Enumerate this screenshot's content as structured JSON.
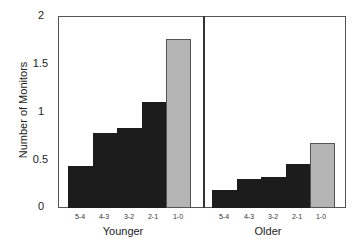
{
  "chart_data": {
    "type": "bar",
    "title": "",
    "ylabel": "Number of Monitors",
    "xlabel": "",
    "ylim": [
      0,
      2
    ],
    "yticks": [
      "0",
      "0.5",
      "1",
      "1.5",
      "2"
    ],
    "grid": false,
    "legend": null,
    "categories": [
      "5-4",
      "4-3",
      "3-2",
      "2-1",
      "1-0"
    ],
    "panels": [
      {
        "name": "Younger",
        "values": [
          0.44,
          0.78,
          0.83,
          1.1,
          1.76
        ],
        "colors": [
          "#1c1c1c",
          "#1c1c1c",
          "#1c1c1c",
          "#1c1c1c",
          "#b4b4b4"
        ]
      },
      {
        "name": "Older",
        "values": [
          0.19,
          0.3,
          0.32,
          0.46,
          0.68
        ],
        "colors": [
          "#1c1c1c",
          "#1c1c1c",
          "#1c1c1c",
          "#1c1c1c",
          "#b4b4b4"
        ]
      }
    ]
  },
  "axis": {
    "ylabel": "Number of Monitors",
    "yticks": [
      "0",
      "0.5",
      "1",
      "1.5",
      "2"
    ]
  },
  "groups": {
    "younger": {
      "label": "Younger",
      "ticks": [
        "5-4",
        "4-3",
        "3-2",
        "2-1",
        "1-0"
      ]
    },
    "older": {
      "label": "Older",
      "ticks": [
        "5-4",
        "4-3",
        "3-2",
        "2-1",
        "1-0"
      ]
    }
  }
}
